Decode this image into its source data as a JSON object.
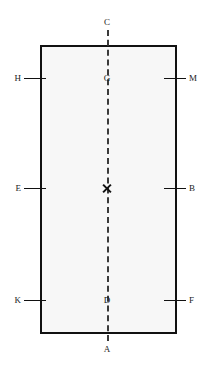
{
  "figure": {
    "title": "",
    "width": 210,
    "height": 365,
    "background_color": "#ffffff"
  },
  "shape": {
    "kind": "rectangle",
    "x": 40,
    "y": 45,
    "width": 137,
    "height": 289,
    "stroke_color": "#111111",
    "stroke_width": 2.5,
    "fill_color": "#f7f7f7"
  },
  "axis": {
    "kind": "dashed-vertical-centerline",
    "x": 107,
    "y_top": 30,
    "y_bottom": 341,
    "stroke_color": "#3a3a3a",
    "stroke_width": 2.5,
    "dash": "8 4"
  },
  "center_marker": {
    "kind": "x-cross",
    "x": 107,
    "y": 188,
    "size": 11,
    "color": "#111111"
  },
  "labels": [
    {
      "text": "C",
      "x": 107,
      "y": 22,
      "align": "center",
      "side": "top"
    },
    {
      "text": "H",
      "x": 21,
      "y": 78,
      "align": "right",
      "side": "left"
    },
    {
      "text": "G",
      "x": 107,
      "y": 78,
      "align": "center",
      "side": "center"
    },
    {
      "text": "M",
      "x": 189,
      "y": 78,
      "align": "left",
      "side": "right"
    },
    {
      "text": "E",
      "x": 21,
      "y": 188,
      "align": "right",
      "side": "left"
    },
    {
      "text": "B",
      "x": 189,
      "y": 188,
      "align": "left",
      "side": "right"
    },
    {
      "text": "K",
      "x": 21,
      "y": 300,
      "align": "right",
      "side": "left"
    },
    {
      "text": "D",
      "x": 107,
      "y": 300,
      "align": "center",
      "side": "center"
    },
    {
      "text": "F",
      "x": 189,
      "y": 300,
      "align": "left",
      "side": "right"
    },
    {
      "text": "A",
      "x": 107,
      "y": 349,
      "align": "center",
      "side": "bottom"
    }
  ],
  "ticks": [
    {
      "name": "tick-H",
      "x": 24,
      "y": 78,
      "length": 22
    },
    {
      "name": "tick-M",
      "x": 164,
      "y": 78,
      "length": 22
    },
    {
      "name": "tick-E",
      "x": 24,
      "y": 188,
      "length": 22
    },
    {
      "name": "tick-B",
      "x": 164,
      "y": 188,
      "length": 22
    },
    {
      "name": "tick-K",
      "x": 24,
      "y": 300,
      "length": 22
    },
    {
      "name": "tick-F",
      "x": 164,
      "y": 300,
      "length": 22
    }
  ]
}
